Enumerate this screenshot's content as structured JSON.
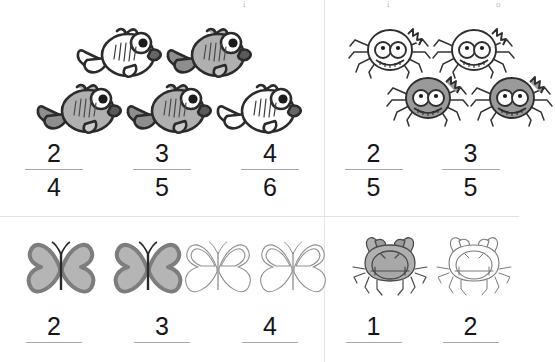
{
  "worksheet": {
    "title": "Fraction Shading Worksheet",
    "background_color": "#ffffff",
    "divider_color": "#e6e6e8",
    "shade_fill": "#b0b0b0",
    "shade_stroke": "#2b2b2b",
    "outline_stroke": "#555555",
    "numeral_color": "#15151a",
    "fraction_bar_color": "#a8a8ac",
    "top_artifacts": [
      "i",
      "i",
      "o"
    ]
  },
  "quadrants": [
    {
      "id": "fish",
      "name": "fish-group",
      "object": "fish",
      "total": 5,
      "shaded": 3,
      "layout": "two-rows",
      "items": [
        {
          "shaded": false,
          "row": 0
        },
        {
          "shaded": true,
          "row": 0
        },
        {
          "shaded": true,
          "row": 1
        },
        {
          "shaded": true,
          "row": 1
        },
        {
          "shaded": false,
          "row": 1
        }
      ],
      "fractions": [
        {
          "numerator": "2",
          "denominator": "4"
        },
        {
          "numerator": "3",
          "denominator": "5"
        },
        {
          "numerator": "4",
          "denominator": "6"
        }
      ]
    },
    {
      "id": "spider",
      "name": "spider-group",
      "object": "spider",
      "total": 4,
      "shaded": 2,
      "layout": "two-rows",
      "items": [
        {
          "shaded": false,
          "row": 0
        },
        {
          "shaded": false,
          "row": 0
        },
        {
          "shaded": true,
          "row": 1
        },
        {
          "shaded": true,
          "row": 1
        }
      ],
      "fractions": [
        {
          "numerator": "2",
          "denominator": "5"
        },
        {
          "numerator": "3",
          "denominator": "5"
        }
      ]
    },
    {
      "id": "butterfly",
      "name": "butterfly-group",
      "object": "butterfly",
      "total": 4,
      "shaded": 2,
      "layout": "single-row",
      "items": [
        {
          "shaded": true
        },
        {
          "shaded": true
        },
        {
          "shaded": false
        },
        {
          "shaded": false
        }
      ],
      "fractions": [
        {
          "numerator": "2",
          "denominator": ""
        },
        {
          "numerator": "3",
          "denominator": ""
        },
        {
          "numerator": "4",
          "denominator": ""
        }
      ]
    },
    {
      "id": "crab",
      "name": "crab-group",
      "object": "crab",
      "total": 2,
      "shaded": 1,
      "layout": "single-row",
      "items": [
        {
          "shaded": true
        },
        {
          "shaded": false
        }
      ],
      "fractions": [
        {
          "numerator": "1",
          "denominator": ""
        },
        {
          "numerator": "2",
          "denominator": ""
        }
      ]
    }
  ]
}
